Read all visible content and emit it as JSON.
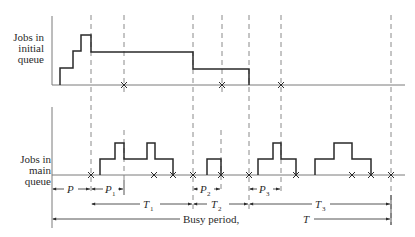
{
  "diagram": {
    "colors": {
      "ink": "#2a2a2a",
      "axis": "#7a7a7a",
      "dash": "#8a8a8a",
      "background": "#ffffff"
    },
    "top_panel": {
      "label_lines": [
        "Jobs in",
        "initial",
        "queue"
      ]
    },
    "bottom_panel": {
      "label_lines": [
        "Jobs in",
        "main",
        "queue"
      ]
    },
    "intervals": {
      "P": {
        "main": "P",
        "sub": ""
      },
      "P1": {
        "main": "P",
        "sub": "1"
      },
      "P2": {
        "main": "P",
        "sub": "2"
      },
      "P3": {
        "main": "P",
        "sub": "3"
      },
      "T1": {
        "main": "T",
        "sub": "1"
      },
      "T2": {
        "main": "T",
        "sub": "2"
      },
      "T3": {
        "main": "T",
        "sub": "3"
      }
    },
    "busy_period": {
      "label": "Busy period, ",
      "symbol": "T"
    },
    "markers": {
      "departure_symbol": "×"
    }
  }
}
